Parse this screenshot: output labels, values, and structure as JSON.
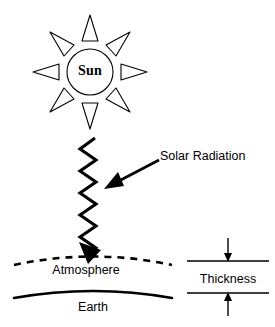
{
  "figure": {
    "title_visible": false,
    "background_color": "#ffffff",
    "stroke_color": "#000000"
  },
  "sun": {
    "label": "Sun",
    "ray_count": 8,
    "ray_shape": "hollow-triangle",
    "center": {
      "x": 90,
      "y": 72
    },
    "radius": 23
  },
  "radiation": {
    "label": "Solar Radiation",
    "wave_shape": "zigzag",
    "wave_top_y": 138,
    "wave_bottom_y": 262,
    "wave_x": 90,
    "arrow_direction": "down-left"
  },
  "atmosphere": {
    "label": "Atmosphere",
    "line_style": "dashed"
  },
  "earth": {
    "label": "Earth",
    "line_style": "solid"
  },
  "thickness": {
    "label": "Thickness",
    "top_rule_y": 261,
    "bottom_rule_y": 293,
    "arrow_top_direction": "down",
    "arrow_bottom_direction": "up"
  }
}
